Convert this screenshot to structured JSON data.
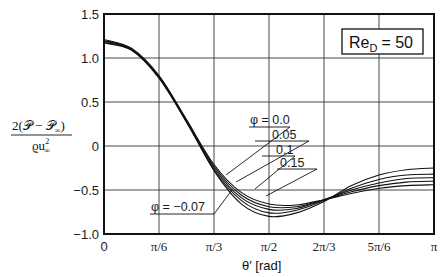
{
  "chart_data": {
    "type": "line",
    "title": "",
    "annotation_box": "Re_D = 50",
    "annotation": {
      "re_text": "Re",
      "re_sub": "D",
      "re_value": "= 50"
    },
    "xlabel": "θ′ [rad]",
    "ylabel": "2(𝒫 − 𝒫∞) / ϱu∞²",
    "ylabel_parts": {
      "numerator": "2(𝒫 − 𝒫",
      "num_sub": "∞",
      "num_close": ")",
      "denominator": "ϱu",
      "den_sup": "2",
      "den_sub": "∞"
    },
    "xlim": [
      0,
      3.1416
    ],
    "ylim": [
      -1.0,
      1.5
    ],
    "x_tick_labels": [
      "0",
      "π/6",
      "π/3",
      "π/2",
      "2π/3",
      "5π/6",
      "π"
    ],
    "y_tick_labels": [
      "1.5",
      "1.0",
      "0.5",
      "0",
      "−0.5",
      "−1.0"
    ],
    "grid": true,
    "x": [
      0,
      0.2618,
      0.5236,
      0.7854,
      1.0472,
      1.309,
      1.5708,
      1.8326,
      2.0944,
      2.3562,
      2.618,
      2.8798,
      3.1416
    ],
    "series": [
      {
        "name": "φ = −0.07",
        "values": [
          1.17,
          1.09,
          0.78,
          0.28,
          -0.28,
          -0.66,
          -0.8,
          -0.76,
          -0.63,
          -0.45,
          -0.33,
          -0.27,
          -0.25
        ]
      },
      {
        "name": "φ = 0.0",
        "values": [
          1.18,
          1.09,
          0.77,
          0.27,
          -0.27,
          -0.62,
          -0.76,
          -0.73,
          -0.62,
          -0.48,
          -0.38,
          -0.33,
          -0.32
        ]
      },
      {
        "name": "φ = 0.05",
        "values": [
          1.19,
          1.1,
          0.78,
          0.28,
          -0.25,
          -0.59,
          -0.72,
          -0.71,
          -0.61,
          -0.5,
          -0.42,
          -0.37,
          -0.36
        ]
      },
      {
        "name": "φ = 0.1",
        "values": [
          1.2,
          1.1,
          0.79,
          0.29,
          -0.23,
          -0.56,
          -0.69,
          -0.69,
          -0.61,
          -0.52,
          -0.45,
          -0.41,
          -0.4
        ]
      },
      {
        "name": "φ = 0.15",
        "values": [
          1.21,
          1.11,
          0.8,
          0.3,
          -0.21,
          -0.53,
          -0.66,
          -0.67,
          -0.61,
          -0.54,
          -0.48,
          -0.45,
          -0.44
        ]
      }
    ],
    "curve_labels": [
      "φ = 0.0",
      "0.05",
      "0.1",
      "0.15",
      "φ = −0.07"
    ]
  }
}
